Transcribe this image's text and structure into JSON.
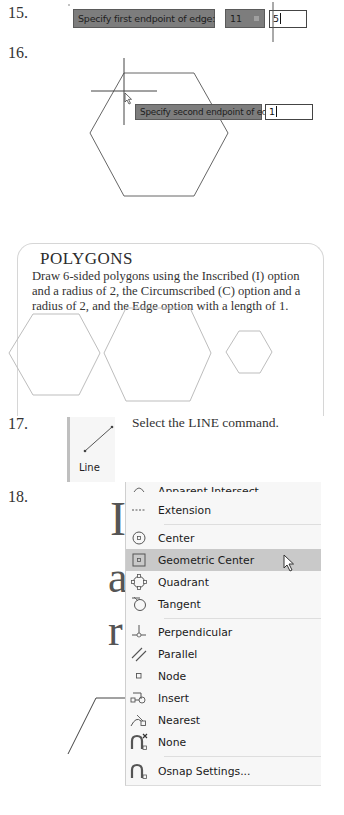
{
  "steps": [
    {
      "number": "15.",
      "prompt": "Specify first endpoint of edge:",
      "coord_x": "11",
      "coord_y": "5"
    },
    {
      "number": "16.",
      "prompt": "Specify second endpoint of edge:",
      "input_value": "1"
    },
    {
      "number": "17.",
      "instruction": "Select the LINE command.",
      "ribbon_button": {
        "label": "Line",
        "icon": "line-icon"
      }
    },
    {
      "number": "18."
    }
  ],
  "callout": {
    "title": "POLYGONS",
    "body_lines": [
      "Draw 6-sided polygons using the Inscribed (I) option",
      "and a radius of 2, the Circumscribed (C) option and a",
      "radius of 2, and the Edge option with a length of 1."
    ],
    "shapes": [
      "inscribed-hexagon",
      "circumscribed-hexagon",
      "edge-hexagon"
    ]
  },
  "background_letters": [
    "I",
    "a",
    "r"
  ],
  "osnap_menu": {
    "items": [
      {
        "label": "Apparent Intersect",
        "icon": "apparent-intersect-icon",
        "partial": true
      },
      {
        "label": "Extension",
        "icon": "extension-icon"
      },
      {
        "label": "Center",
        "icon": "center-icon"
      },
      {
        "label": "Geometric Center",
        "icon": "geometric-center-icon",
        "highlighted": true
      },
      {
        "label": "Quadrant",
        "icon": "quadrant-icon"
      },
      {
        "label": "Tangent",
        "icon": "tangent-icon"
      },
      {
        "label": "Perpendicular",
        "icon": "perpendicular-icon"
      },
      {
        "label": "Parallel",
        "icon": "parallel-icon"
      },
      {
        "label": "Node",
        "icon": "node-icon"
      },
      {
        "label": "Insert",
        "icon": "insert-icon"
      },
      {
        "label": "Nearest",
        "icon": "nearest-icon"
      },
      {
        "label": "None",
        "icon": "none-icon"
      },
      {
        "label": "Osnap Settings...",
        "icon": "osnap-settings-icon"
      }
    ]
  },
  "colors": {
    "tooltip_bg": "#7d7d7d",
    "menu_bg": "#f7f7f7",
    "menu_highlight": "#c9c9c9",
    "card_border": "#d6d6d6"
  }
}
